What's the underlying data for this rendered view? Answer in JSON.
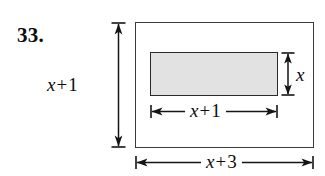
{
  "figure": {
    "problem_number": "33.",
    "background_color": "#ffffff",
    "line_color": "#2a2a2a",
    "shaded_fill_color": "#e2e2e2",
    "outer_rectangle": {
      "name": "outer-rectangle",
      "fill": "#ffffff",
      "stroke": "#3a3a3a",
      "width_label": "x + 3",
      "height_label": "x + 1"
    },
    "inner_rectangle": {
      "name": "inner-shaded-rectangle",
      "fill": "#e2e2e2",
      "stroke": "#2a2a2a",
      "width_label": "x + 1",
      "height_label": "x"
    },
    "dimensions": [
      {
        "id": "outer-height",
        "orientation": "vertical",
        "position": "left",
        "variable": "x",
        "operator": "+",
        "constant": "1",
        "label": "x + 1"
      },
      {
        "id": "inner-height",
        "orientation": "vertical",
        "position": "right",
        "variable": "x",
        "operator": "",
        "constant": "",
        "label": "x"
      },
      {
        "id": "inner-width",
        "orientation": "horizontal",
        "position": "below-inner-rectangle",
        "variable": "x",
        "operator": "+",
        "constant": "1",
        "label": "x + 1"
      },
      {
        "id": "outer-width",
        "orientation": "horizontal",
        "position": "bottom",
        "variable": "x",
        "operator": "+",
        "constant": "3",
        "label": "x + 3"
      }
    ]
  }
}
